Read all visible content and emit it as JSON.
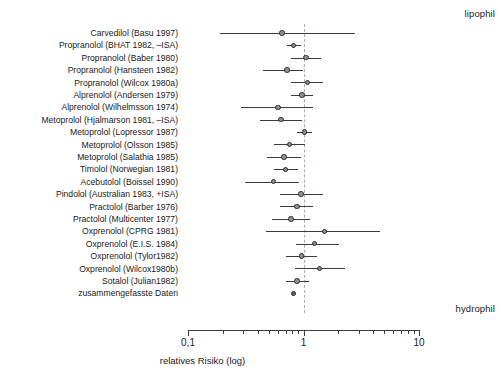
{
  "annotations": {
    "top_right": "lipophil",
    "bottom_right": "hydrophil"
  },
  "axis": {
    "title": "relatives Risiko (log)",
    "tick_labels": [
      "0,1",
      "1",
      "10"
    ]
  },
  "chart_data": {
    "type": "forest",
    "title": "",
    "xlabel": "relatives Risiko (log)",
    "ylabel": "",
    "scale": "log10",
    "xlim": [
      0.1,
      10
    ],
    "xticks": [
      0.1,
      1,
      10
    ],
    "xtick_labels": [
      "0,1",
      "1",
      "10"
    ],
    "minor_ticks": [
      0.2,
      0.3,
      0.4,
      0.5,
      0.6,
      0.7,
      0.8,
      0.9,
      2,
      3,
      4,
      5,
      6,
      7,
      8,
      9
    ],
    "null_line": 1,
    "grid": false,
    "legend": null,
    "annotations": [
      {
        "text": "lipophil",
        "position": "top-right"
      },
      {
        "text": "hydrophil",
        "position": "bottom-right"
      }
    ],
    "categories": [
      "Carvedilol (Basu 1997)",
      "Propranolol (BHAT 1982, –ISA)",
      "Propranolol (Baber 1980)",
      "Propranolol (Hansteen 1982)",
      "Propranolol (Wilcox 1980a)",
      "Alprenolol (Andersen 1979)",
      "Alprenolol (Wilhelmsson 1974)",
      "Metoprolol (Hjalmarson 1981, –ISA)",
      "Metoprolol (Lopressor 1987)",
      "Metoprolol (Olsson 1985)",
      "Metoprolol (Salathia 1985)",
      "Timolol (Norwegian 1981)",
      "Acebutolol (Boissel 1990)",
      "Pindolol (Australian 1983, +ISA)",
      "Practolol (Barber 1976)",
      "Practolol (Multicenter 1977)",
      "Oxprenolol (CPRG 1981)",
      "Oxprenolol (E.I.S. 1984)",
      "Oxprenolol (Tylor1982)",
      "Oxprenolol (Wilcox1980b)",
      "Sotalol (Julian1982)",
      "zusammengefasste Daten"
    ],
    "values": [
      0.65,
      0.82,
      1.05,
      0.72,
      1.08,
      0.97,
      0.6,
      0.64,
      1.02,
      0.76,
      0.68,
      0.7,
      0.55,
      0.95,
      0.88,
      0.78,
      1.52,
      1.25,
      0.96,
      1.38,
      0.88,
      0.82
    ],
    "ci_low": [
      0.19,
      0.72,
      0.78,
      0.45,
      0.78,
      0.78,
      0.29,
      0.42,
      0.88,
      0.55,
      0.48,
      0.55,
      0.31,
      0.62,
      0.63,
      0.53,
      0.47,
      0.86,
      0.7,
      0.84,
      0.71,
      0.82
    ],
    "ci_high": [
      2.8,
      0.95,
      1.42,
      1.0,
      1.48,
      1.22,
      1.21,
      0.97,
      1.18,
      1.04,
      0.95,
      0.9,
      0.92,
      1.48,
      1.22,
      1.13,
      4.6,
      2.05,
      1.3,
      2.3,
      1.12,
      0.82
    ],
    "series": [
      {
        "name": "relatives Risiko",
        "marker": "circle",
        "marker_color": "#8f8f8f",
        "line_color": "#3b3b3b"
      }
    ],
    "pooled_index": 21
  }
}
